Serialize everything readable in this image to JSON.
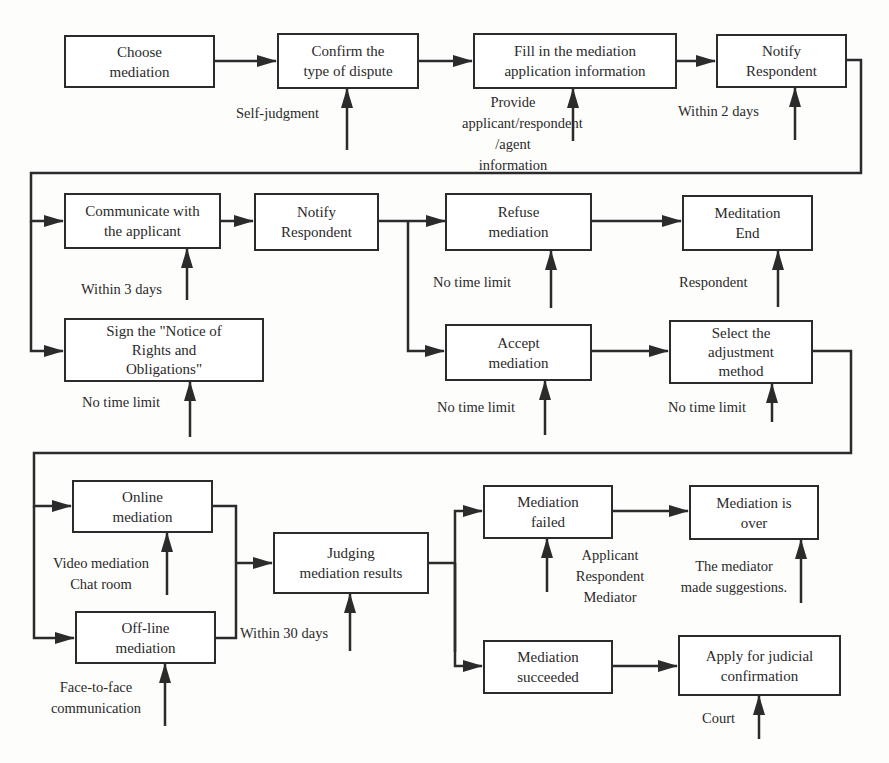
{
  "diagram": {
    "type": "flowchart",
    "title": "",
    "colors": {
      "line": "#2b2b2b",
      "text": "#2a2a2a",
      "background": "#fdfdfc"
    },
    "nodes": {
      "choose_mediation": "Choose\nmediation",
      "confirm_dispute_type": "Confirm the\ntype of dispute",
      "fill_application": "Fill in the mediation\napplication information",
      "notify_respondent_1": "Notify\nRespondent",
      "communicate_applicant": "Communicate with\nthe applicant",
      "notify_respondent_2": "Notify\nRespondent",
      "refuse_mediation": "Refuse\nmediation",
      "meditation_end": "Meditation\nEnd",
      "sign_notice": "Sign the \"Notice of\nRights and\nObligations\"",
      "accept_mediation": "Accept\nmediation",
      "select_method": "Select the\nadjustment\nmethod",
      "online_mediation": "Online\nmediation",
      "offline_mediation": "Off-line\nmediation",
      "judging_results": "Judging\nmediation results",
      "mediation_failed": "Mediation\nfailed",
      "mediation_over": "Mediation is\nover",
      "mediation_succeeded": "Mediation\nsucceeded",
      "apply_judicial": "Apply for judicial\nconfirmation"
    },
    "annotations": {
      "self_judgment": "Self-judgment",
      "provide_info": "Provide\napplicant/respondent\n/agent information",
      "within_2_days": "Within 2 days",
      "within_3_days": "Within 3 days",
      "refuse_no_limit": "No time limit",
      "respondent": "Respondent",
      "sign_no_limit": "No time limit",
      "accept_no_limit": "No time limit",
      "select_no_limit": "No time limit",
      "online_methods": "Video mediation\nChat room",
      "within_30_days": "Within 30 days",
      "offline_methods": "Face-to-face\ncommunication",
      "failed_parties": "Applicant\nRespondent\nMediator",
      "mediator_suggestions": "The mediator\nmade suggestions.",
      "court": "Court"
    },
    "edges": [
      [
        "choose_mediation",
        "confirm_dispute_type"
      ],
      [
        "confirm_dispute_type",
        "fill_application"
      ],
      [
        "fill_application",
        "notify_respondent_1"
      ],
      [
        "notify_respondent_1",
        "communicate_applicant"
      ],
      [
        "notify_respondent_1",
        "sign_notice"
      ],
      [
        "communicate_applicant",
        "notify_respondent_2"
      ],
      [
        "notify_respondent_2",
        "refuse_mediation"
      ],
      [
        "notify_respondent_2",
        "accept_mediation"
      ],
      [
        "refuse_mediation",
        "meditation_end"
      ],
      [
        "accept_mediation",
        "select_method"
      ],
      [
        "select_method",
        "online_mediation"
      ],
      [
        "select_method",
        "offline_mediation"
      ],
      [
        "online_mediation",
        "judging_results"
      ],
      [
        "offline_mediation",
        "judging_results"
      ],
      [
        "judging_results",
        "mediation_failed"
      ],
      [
        "judging_results",
        "mediation_succeeded"
      ],
      [
        "mediation_failed",
        "mediation_over"
      ],
      [
        "mediation_succeeded",
        "apply_judicial"
      ]
    ]
  }
}
